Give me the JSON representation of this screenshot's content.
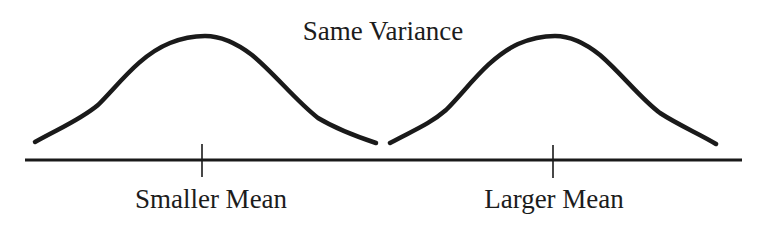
{
  "diagram": {
    "title": "Same Variance",
    "axis": {
      "x_start": 25,
      "x_end": 742,
      "y": 160,
      "color": "#1a1a1a"
    },
    "curves": [
      {
        "name": "smaller-mean-distribution",
        "mean_x": 203,
        "peak_y": 36,
        "start": [
          35,
          142
        ],
        "end": [
          376,
          143
        ],
        "tick_label": "Smaller Mean"
      },
      {
        "name": "larger-mean-distribution",
        "mean_x": 553,
        "peak_y": 36,
        "start": [
          390,
          143
        ],
        "end": [
          716,
          144
        ],
        "tick_label": "Larger Mean"
      }
    ],
    "ticks": [
      {
        "x": 202,
        "label": "Smaller Mean"
      },
      {
        "x": 553,
        "label": "Larger Mean"
      }
    ],
    "stroke_color": "#1a1a1a"
  }
}
